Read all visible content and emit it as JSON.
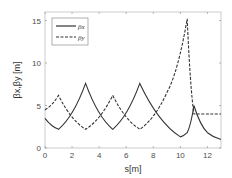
{
  "chart_data": {
    "type": "line",
    "title": "",
    "xlabel": "s[m]",
    "ylabel": "βx,βy [m]",
    "xlim": [
      0,
      13
    ],
    "ylim": [
      0,
      16
    ],
    "xticks": [
      0,
      2,
      4,
      6,
      8,
      10,
      12
    ],
    "yticks": [
      0,
      5,
      10,
      15
    ],
    "grid": false,
    "legend_position": "upper left",
    "series": [
      {
        "name": "βx",
        "style": "solid",
        "color": "#333333",
        "x": [
          0,
          1,
          3,
          5,
          7,
          10,
          10.5,
          11,
          12,
          13
        ],
        "y": [
          3.5,
          2.2,
          7.6,
          2.2,
          7.6,
          1.3,
          1.8,
          5.0,
          1.8,
          1.0
        ]
      },
      {
        "name": "βy",
        "style": "dashed",
        "color": "#333333",
        "x": [
          0,
          1,
          3,
          5,
          7,
          9,
          10.5,
          11,
          12,
          13
        ],
        "y": [
          4.5,
          6.2,
          2.2,
          6.2,
          2.2,
          6.5,
          15.2,
          4.0,
          4.0,
          4.0
        ]
      }
    ]
  },
  "labels": {
    "xlabel": "s[m]",
    "ylabel": "βx,βy [m]",
    "legend": [
      "βx",
      "βy"
    ],
    "xticks": [
      "0",
      "2",
      "4",
      "6",
      "8",
      "10",
      "12"
    ],
    "yticks": [
      "0",
      "5",
      "10",
      "15"
    ]
  }
}
